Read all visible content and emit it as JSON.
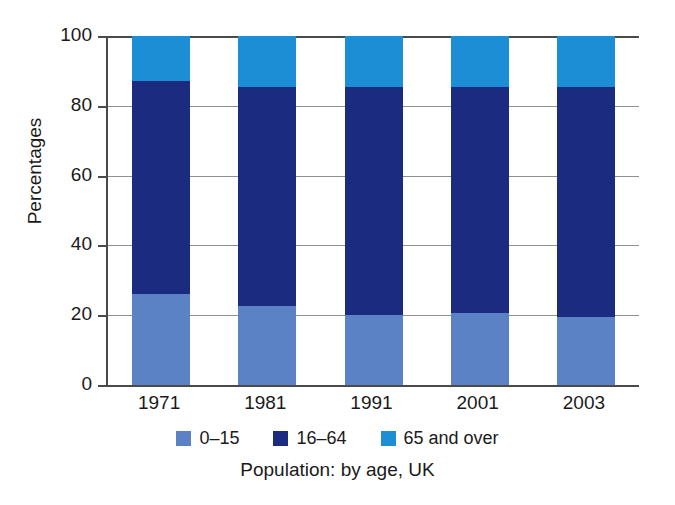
{
  "chart_data": {
    "type": "bar",
    "subtype": "stacked-100-percent",
    "title": "",
    "caption": "Population: by age, UK",
    "xlabel": "",
    "ylabel": "Percentages",
    "categories": [
      "1971",
      "1981",
      "1991",
      "2001",
      "2003"
    ],
    "ylim": [
      0,
      100
    ],
    "yticks": [
      0,
      20,
      40,
      60,
      80,
      100
    ],
    "ytick_labels": [
      "0",
      "20",
      "40",
      "60",
      "80",
      "100"
    ],
    "grid": true,
    "grid_axis": "y",
    "legend_position": "bottom",
    "series": [
      {
        "name": "0–15",
        "color": "#5b82c4",
        "values": [
          26.0,
          22.5,
          20.0,
          20.5,
          19.5
        ]
      },
      {
        "name": "16–64",
        "color": "#1b2b80",
        "values": [
          61.0,
          62.8,
          65.5,
          65.0,
          66.0
        ]
      },
      {
        "name": "65 and over",
        "color": "#1b8ed6",
        "values": [
          13.0,
          14.7,
          14.5,
          14.5,
          14.5
        ]
      }
    ]
  },
  "axes": {
    "y_title": "Percentages"
  },
  "legend": {
    "items": [
      {
        "label": "0–15",
        "color": "#5b82c4",
        "swatch_name": "legend-swatch-0-15"
      },
      {
        "label": "16–64",
        "color": "#1b2b80",
        "swatch_name": "legend-swatch-16-64"
      },
      {
        "label": "65 and over",
        "color": "#1b8ed6",
        "swatch_name": "legend-swatch-65-and-over"
      }
    ]
  },
  "caption": {
    "text": "Population: by age, UK"
  },
  "colors": {
    "background": "#ffffff",
    "axis": "#4a4a4a",
    "gridline": "#8f8f8f",
    "text": "#1a1a1a"
  }
}
